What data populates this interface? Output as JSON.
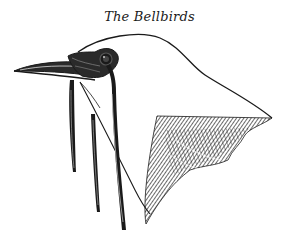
{
  "title": "The Bellbirds",
  "illustration": {
    "subject": "bellbird head with hanging wattles",
    "style": "engraving",
    "ink_color": "#1a1a1a",
    "paper_color": "#ffffff"
  }
}
